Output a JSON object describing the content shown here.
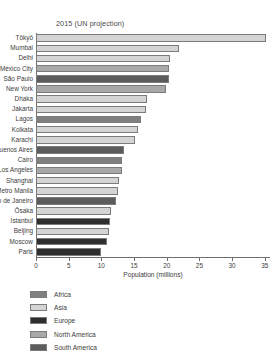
{
  "chart_data": {
    "type": "bar",
    "orientation": "horizontal",
    "title": "2015 (UN projection)",
    "xlabel": "Population (millions)",
    "ylabel": "",
    "xlim": [
      0,
      35.8
    ],
    "xticks": [
      0,
      5,
      10,
      15,
      20,
      25,
      30,
      35
    ],
    "xtick_labels": [
      "0",
      "5",
      "10",
      "15",
      "20",
      "25",
      "30",
      "35"
    ],
    "grid": false,
    "legend_position": "below-left",
    "categories": [
      "Tōkyō",
      "Mumbai",
      "Delhi",
      "México City",
      "São Paulo",
      "New York",
      "Dhaka",
      "Jakarta",
      "Lagos",
      "Kolkata",
      "Karachi",
      "Buenos Aires",
      "Cairo",
      "Los Angeles",
      "Shanghai",
      "Metro Manila",
      "Rio de Janeiro",
      "Ōsaka",
      "İstanbul",
      "Beijing",
      "Moscow",
      "Paris"
    ],
    "values": [
      35.2,
      21.9,
      20.5,
      20.4,
      20.3,
      19.9,
      17.0,
      16.8,
      16.1,
      15.6,
      15.2,
      13.4,
      13.1,
      13.1,
      12.7,
      12.6,
      12.2,
      11.4,
      11.3,
      11.2,
      10.9,
      10.0
    ],
    "groups": [
      "Asia",
      "Asia",
      "Asia",
      "North America",
      "South America",
      "North America",
      "Asia",
      "Asia",
      "Africa",
      "Asia",
      "Asia",
      "South America",
      "Africa",
      "North America",
      "Asia",
      "Asia",
      "South America",
      "Asia",
      "Europe",
      "Asia",
      "Europe",
      "Europe"
    ],
    "legend": [
      {
        "label": "Africa",
        "color": "#808080"
      },
      {
        "label": "Asia",
        "color": "#d4d4d4"
      },
      {
        "label": "Europe",
        "color": "#2f2f2f"
      },
      {
        "label": "North America",
        "color": "#a8a8a8"
      },
      {
        "label": "South America",
        "color": "#5c5c5c"
      }
    ],
    "group_colors": {
      "Africa": "#808080",
      "Asia": "#d4d4d4",
      "Europe": "#2f2f2f",
      "North America": "#a8a8a8",
      "South America": "#5c5c5c"
    }
  }
}
